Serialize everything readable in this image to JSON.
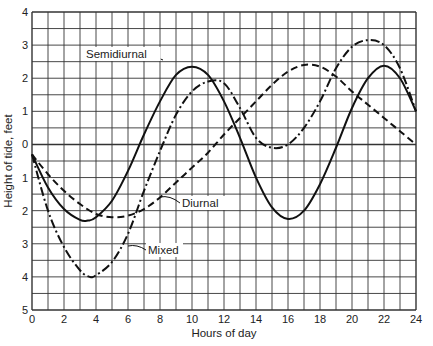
{
  "chart_data": {
    "type": "line",
    "title": "",
    "xlabel": "Hours of day",
    "ylabel": "Height of tide, feet",
    "xlim": [
      0,
      24
    ],
    "ylim": [
      -5,
      4
    ],
    "x_ticks": [
      0,
      2,
      4,
      6,
      8,
      10,
      12,
      14,
      16,
      18,
      20,
      22,
      24
    ],
    "x_tick_labels": [
      "0",
      "2",
      "4",
      "6",
      "8",
      "10",
      "12",
      "14",
      "16",
      "18",
      "20",
      "22",
      "24"
    ],
    "y_ticks": [
      4,
      3,
      2,
      1,
      0,
      -1,
      -2,
      -3,
      -4,
      -5
    ],
    "y_tick_labels": [
      "4",
      "3",
      "2",
      "1",
      "0",
      "1",
      "2",
      "3",
      "4",
      "5"
    ],
    "grid": true,
    "grid_x_step": 1,
    "grid_y_step": 0.5,
    "legend": "inline annotations",
    "series": [
      {
        "name": "Semidiurnal",
        "style": "solid",
        "x": [
          0,
          1,
          2,
          3,
          3.5,
          4,
          5,
          6,
          7,
          8,
          9,
          10,
          11,
          12,
          13,
          14,
          15,
          16,
          17,
          18,
          19,
          20,
          21,
          22,
          23,
          24
        ],
        "y": [
          -0.3,
          -1.3,
          -1.95,
          -2.28,
          -2.3,
          -2.2,
          -1.7,
          -0.8,
          0.3,
          1.3,
          2.1,
          2.35,
          2.1,
          1.3,
          0.2,
          -1.0,
          -1.9,
          -2.25,
          -2.0,
          -1.2,
          -0.1,
          1.1,
          2.0,
          2.38,
          2.0,
          1.0
        ],
        "annotation": {
          "text": "Semidiurnal",
          "at_x": 8.3,
          "at_y": 1.75
        }
      },
      {
        "name": "Diurnal",
        "style": "dashed",
        "x": [
          0,
          1,
          2,
          3,
          4,
          5,
          6,
          7,
          8,
          9,
          10,
          11,
          12,
          13,
          14,
          15,
          16,
          17,
          18,
          19,
          20,
          21,
          22,
          23,
          24
        ],
        "y": [
          -0.3,
          -0.9,
          -1.4,
          -1.8,
          -2.1,
          -2.2,
          -2.15,
          -1.95,
          -1.6,
          -1.15,
          -0.7,
          -0.25,
          0.3,
          0.8,
          1.3,
          1.8,
          2.2,
          2.4,
          2.35,
          2.05,
          1.6,
          1.2,
          0.8,
          0.4,
          0.0
        ],
        "annotation": {
          "text": "Diurnal",
          "at_x": 8.2,
          "at_y": -1.6
        }
      },
      {
        "name": "Mixed",
        "style": "dash-dot",
        "x": [
          0,
          1,
          2,
          3,
          3.6,
          4,
          5,
          6,
          7,
          8,
          9,
          10,
          11,
          12,
          13,
          14,
          15,
          16,
          17,
          18,
          19,
          20,
          21,
          22,
          23,
          24
        ],
        "y": [
          -0.3,
          -2.0,
          -3.1,
          -3.8,
          -4.0,
          -3.95,
          -3.55,
          -2.7,
          -1.4,
          -0.2,
          0.9,
          1.6,
          1.9,
          1.85,
          1.1,
          0.2,
          -0.1,
          0.0,
          0.5,
          1.3,
          2.3,
          2.95,
          3.15,
          3.0,
          2.3,
          1.0
        ],
        "annotation": {
          "text": "Mixed",
          "at_x": 5.6,
          "at_y": -3.2
        }
      }
    ]
  }
}
